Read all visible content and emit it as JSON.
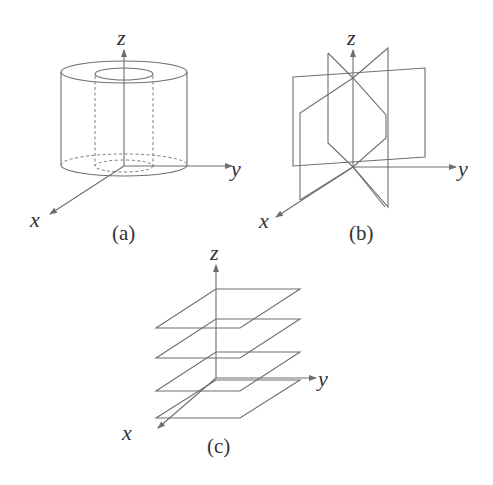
{
  "figure": {
    "panels": [
      {
        "id": "a",
        "caption": "(a)",
        "description": "hollow cylinder (annular region) centered on z-axis",
        "axes": {
          "x": "x",
          "y": "y",
          "z": "z"
        }
      },
      {
        "id": "b",
        "caption": "(b)",
        "description": "half-planes through the z-axis at various angles",
        "axes": {
          "x": "x",
          "y": "y",
          "z": "z"
        }
      },
      {
        "id": "c",
        "caption": "(c)",
        "description": "stack of horizontal planes z = constant",
        "axes": {
          "x": "x",
          "y": "y",
          "z": "z"
        }
      }
    ]
  }
}
